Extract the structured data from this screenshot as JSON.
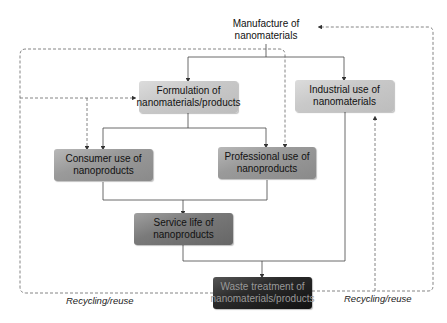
{
  "nodes": {
    "manufacture": "Manufacture of nanomaterials",
    "formulation": "Formulation of nanomaterials/products",
    "industrial": "Industrial use of nanomaterials",
    "consumer": "Consumer use of nanoproducts",
    "professional": "Professional use of nanoproducts",
    "service": "Service life of nanoproducts",
    "waste": "Waste treatment of nanomaterials/products"
  },
  "labels": {
    "recycling_left": "Recycling/reuse",
    "recycling_right": "Recycling/reuse"
  },
  "colors": {
    "line": "#444444",
    "dashed": "#666666"
  }
}
